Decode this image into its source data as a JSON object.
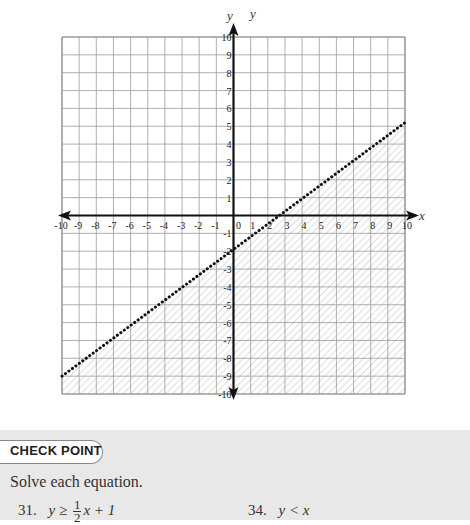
{
  "chart_data": {
    "type": "line",
    "title": "",
    "xlabel": "x",
    "ylabel": "y",
    "xlim": [
      -10,
      10
    ],
    "ylim": [
      -10,
      10
    ],
    "grid": true,
    "x_ticks": [
      -10,
      -9,
      -8,
      -7,
      -6,
      -5,
      -4,
      -3,
      -2,
      -1,
      0,
      1,
      2,
      3,
      4,
      5,
      6,
      7,
      8,
      9,
      10
    ],
    "y_ticks": [
      -10,
      -9,
      -8,
      -7,
      -6,
      -5,
      -4,
      -3,
      -2,
      -1,
      1,
      2,
      3,
      4,
      5,
      6,
      7,
      8,
      9,
      10
    ],
    "series": [
      {
        "name": "boundary line (dotted)",
        "style": "dotted",
        "x": [
          -10,
          10
        ],
        "y": [
          -9,
          5.2
        ]
      }
    ],
    "shaded_region": "below the boundary line (hatched)",
    "extra_labels": [
      "y",
      "y"
    ]
  },
  "axes": {
    "x_label": "x",
    "y_label": "y",
    "y_label_extra": "y",
    "origin_label": "0"
  },
  "checkpoint": {
    "title": "CHECK POINT",
    "instruction": "Solve each equation.",
    "problems": [
      {
        "number": "31.",
        "lhs": "y",
        "op": "≥",
        "num": "1",
        "den": "2",
        "rhs_tail": "x + 1"
      },
      {
        "number": "34.",
        "expression": "y < x"
      }
    ]
  }
}
